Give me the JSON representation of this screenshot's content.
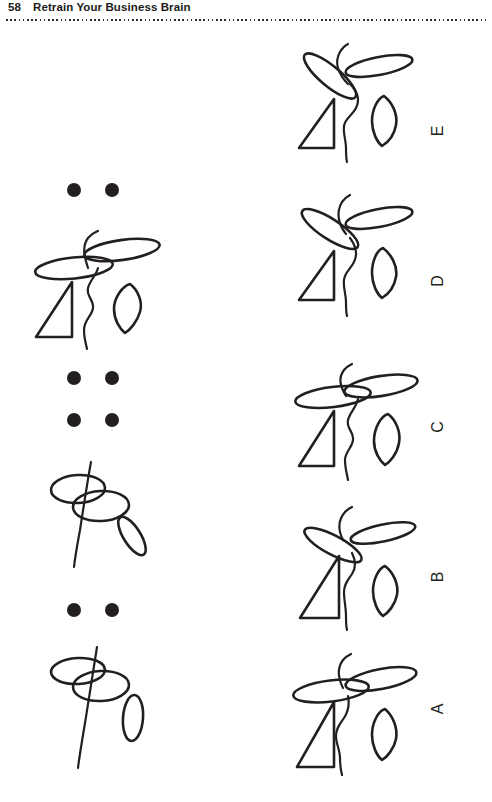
{
  "page": {
    "folio": "58",
    "running_title": "Retrain Your Business Brain",
    "rule_style": "dotted",
    "background_color": "#ffffff",
    "ink_color": "#231f20"
  },
  "puzzle": {
    "type": "visual-sequence-analogy",
    "sequence_column": {
      "label": "question-sequence",
      "items": [
        {
          "kind": "dots",
          "count": 2,
          "layout": "single-row"
        },
        {
          "kind": "figure",
          "id": "seq-figure-1",
          "parts": [
            "ellipse-left",
            "ellipse-right",
            "triangle",
            "leaf",
            "squiggle"
          ]
        },
        {
          "kind": "dots",
          "count": 2,
          "layout": "single-row"
        },
        {
          "kind": "dots",
          "count": 2,
          "layout": "single-row"
        },
        {
          "kind": "figure",
          "id": "seq-figure-2",
          "parts": [
            "ellipse-upper",
            "ellipse-lower",
            "stem-line",
            "small-slanted-ellipse"
          ]
        },
        {
          "kind": "dots",
          "count": 2,
          "layout": "single-row"
        },
        {
          "kind": "figure",
          "id": "seq-figure-3",
          "parts": [
            "ellipse-upper",
            "ellipse-lower",
            "stem-line",
            "small-vertical-ellipse"
          ]
        }
      ]
    },
    "answer_column": {
      "label": "answer-options",
      "options": [
        {
          "letter": "E",
          "id": "option-e"
        },
        {
          "letter": "D",
          "id": "option-d"
        },
        {
          "letter": "C",
          "id": "option-c"
        },
        {
          "letter": "B",
          "id": "option-b"
        },
        {
          "letter": "A",
          "id": "option-a"
        }
      ]
    }
  }
}
